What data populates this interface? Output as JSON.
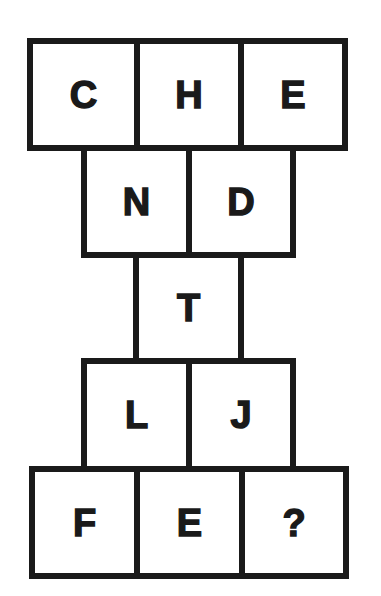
{
  "puzzle": {
    "rows": [
      {
        "cells": [
          "C",
          "H",
          "E"
        ]
      },
      {
        "cells": [
          "N",
          "D"
        ]
      },
      {
        "cells": [
          "T"
        ]
      },
      {
        "cells": [
          "L",
          "J"
        ]
      },
      {
        "cells": [
          "F",
          "E",
          "?"
        ]
      }
    ]
  },
  "colors": {
    "ink": "#1a1a1a",
    "background": "#ffffff"
  }
}
